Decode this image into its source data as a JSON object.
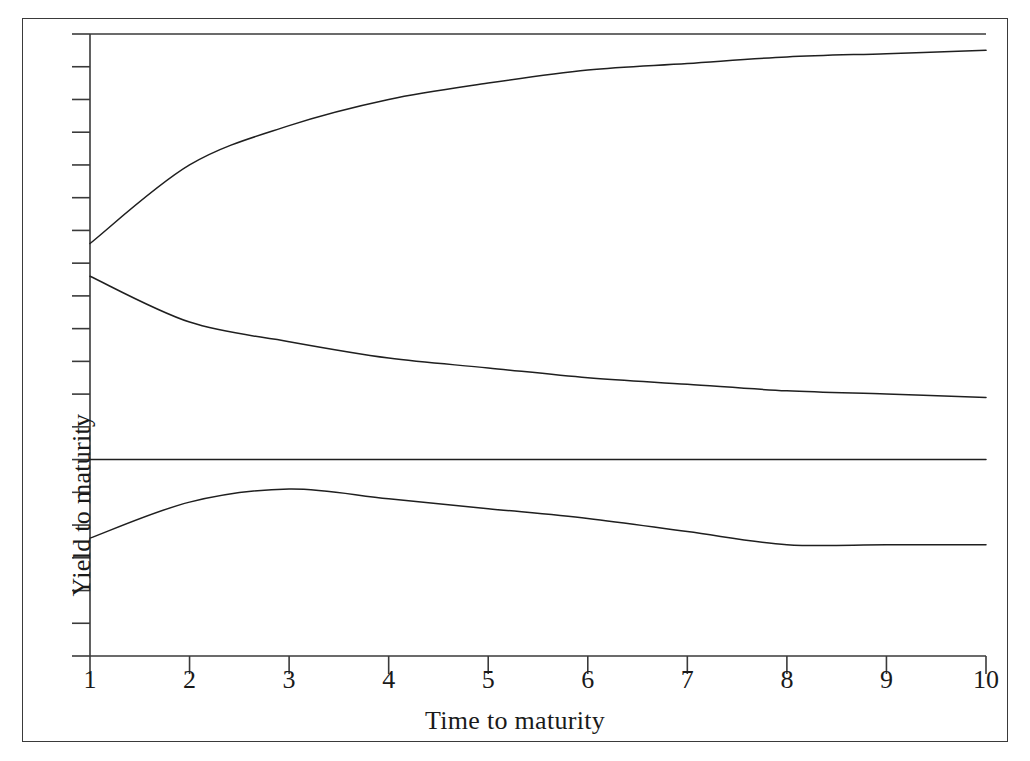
{
  "figure": {
    "axis_labels": {
      "x": "Time to maturity",
      "y": "Yield to maturity"
    },
    "frame": {
      "border_color": "#3a3a3a",
      "background": "#ffffff"
    },
    "line_color": "#1f1f1f"
  },
  "chart_data": {
    "type": "line",
    "title": "",
    "xlabel": "Time to maturity",
    "ylabel": "Yield to maturity",
    "xlim": [
      1,
      10
    ],
    "ylim": [
      0,
      19
    ],
    "grid": false,
    "legend": null,
    "x_tick_labels": [
      "1",
      "2",
      "3",
      "4",
      "5",
      "6",
      "7",
      "8",
      "9",
      "10"
    ],
    "x": [
      1,
      2,
      3,
      4,
      5,
      6,
      7,
      8,
      9,
      10
    ],
    "y_ticks_unlabeled": 19,
    "series": [
      {
        "name": "upward-sloping yield curve",
        "values": [
          12.6,
          15.0,
          16.2,
          17.0,
          17.5,
          17.9,
          18.1,
          18.3,
          18.4,
          18.5
        ]
      },
      {
        "name": "downward-sloping yield curve",
        "values": [
          11.6,
          10.2,
          9.6,
          9.1,
          8.8,
          8.5,
          8.3,
          8.1,
          8.0,
          7.9
        ]
      },
      {
        "name": "flat yield curve",
        "values": [
          6.0,
          6.0,
          6.0,
          6.0,
          6.0,
          6.0,
          6.0,
          6.0,
          6.0,
          6.0
        ]
      },
      {
        "name": "humped yield curve",
        "values": [
          3.6,
          4.7,
          5.1,
          4.8,
          4.5,
          4.2,
          3.8,
          3.4,
          3.4,
          3.4
        ]
      }
    ]
  }
}
